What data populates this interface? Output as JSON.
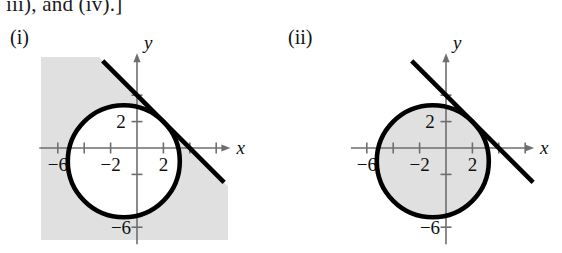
{
  "page": {
    "caption_line": "iii), and (iv).]",
    "background_color": "#ffffff",
    "shade_color": "#e0e0e0",
    "curve_color": "#000000",
    "axis_color": "#6e6e6e"
  },
  "panels": [
    {
      "label": "(i)",
      "origin_px": {
        "x": 137,
        "y": 148
      },
      "unit_px": 13.2,
      "axis_labels": {
        "x": "x",
        "y": "y"
      },
      "x_ticks": [
        {
          "value": -6,
          "label": "-6"
        },
        {
          "value": -4,
          "label": ""
        },
        {
          "value": -2,
          "label": "-2"
        },
        {
          "value": 2,
          "label": "2"
        },
        {
          "value": 4,
          "label": ""
        },
        {
          "value": 6,
          "label": ""
        }
      ],
      "y_ticks": [
        {
          "value": 4,
          "label": ""
        },
        {
          "value": 2,
          "label": "2"
        },
        {
          "value": -2,
          "label": ""
        },
        {
          "value": -6,
          "label": "-6"
        }
      ],
      "shading": "outside-circle-below-line",
      "shading_description": "region outside the circle and on the lower-left side of the line"
    },
    {
      "label": "(ii)",
      "origin_px": {
        "x": 446,
        "y": 148
      },
      "unit_px": 13.2,
      "axis_labels": {
        "x": "x",
        "y": "y"
      },
      "x_ticks": [
        {
          "value": -6,
          "label": "-6"
        },
        {
          "value": -4,
          "label": ""
        },
        {
          "value": -2,
          "label": "-2"
        },
        {
          "value": 2,
          "label": "2"
        },
        {
          "value": 4,
          "label": ""
        },
        {
          "value": 6,
          "label": ""
        }
      ],
      "y_ticks": [
        {
          "value": 4,
          "label": ""
        },
        {
          "value": 2,
          "label": "2"
        },
        {
          "value": -2,
          "label": ""
        },
        {
          "value": -6,
          "label": "-6"
        }
      ],
      "shading": "inside-circle-below-line",
      "shading_description": "region inside the circle and on the lower-left side of the line"
    }
  ],
  "chart_data": {
    "type": "scatter",
    "title": "",
    "xlabel": "x",
    "ylabel": "y",
    "grid": false,
    "legend": "none",
    "panel_count": 2,
    "xlim": [
      -8,
      8
    ],
    "ylim": [
      -8,
      8
    ],
    "shared_geometry": {
      "circle": {
        "center": [
          -1,
          -1
        ],
        "radius": 4.243,
        "equation": "(x + 1)^2 + (y + 1)^2 = 18",
        "passes_through": [
          [
            0,
            4
          ],
          [
            4,
            0
          ],
          [
            -6,
            0
          ],
          [
            0,
            -6
          ]
        ]
      },
      "line": {
        "slope": -1,
        "intercept": 4,
        "equation": "x + y = 4",
        "passes_through": [
          [
            0,
            4
          ],
          [
            4,
            0
          ]
        ],
        "drawn_from": [
          -2.6,
          6.6
        ],
        "drawn_to": [
          6.6,
          -2.6
        ]
      }
    },
    "panels": [
      {
        "label": "(i)",
        "shaded_region": "outside circle AND below line",
        "inequalities": [
          "(x + 1)^2 + (y + 1)^2 >= 18",
          "x + y <= 4"
        ]
      },
      {
        "label": "(ii)",
        "shaded_region": "inside circle AND below line",
        "inequalities": [
          "(x + 1)^2 + (y + 1)^2 <= 18",
          "x + y <= 4"
        ]
      }
    ]
  }
}
